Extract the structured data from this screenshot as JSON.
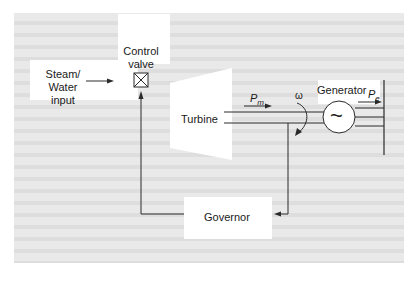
{
  "diagram": {
    "title_faint": "Turbine Governor",
    "nodes": {
      "steam_input": {
        "label_line1": "Steam/ Water",
        "label_line2": "input"
      },
      "control_valve": {
        "label_line1": "Control",
        "label_line2": "valve"
      },
      "turbine": {
        "label": "Turbine"
      },
      "generator": {
        "label": "Generator"
      },
      "governor": {
        "label": "Governor"
      }
    },
    "symbols": {
      "mechanical_power": "P",
      "mechanical_power_sub": "m",
      "electrical_power": "P",
      "electrical_power_sub": "e",
      "speed": "ω",
      "generator_glyph": "~"
    },
    "colors": {
      "background_panel": "#e9e9e9",
      "line": "#2a2a2a",
      "box_fill": "#ffffff"
    }
  }
}
